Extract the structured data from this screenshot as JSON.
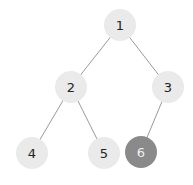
{
  "diagram": {
    "type": "binary-tree",
    "nodes": [
      {
        "id": "1",
        "label": "1",
        "x": 120,
        "y": 25,
        "fill": "#eaeaea",
        "text_color": "#222222",
        "highlighted": false
      },
      {
        "id": "2",
        "label": "2",
        "x": 71,
        "y": 87,
        "fill": "#eaeaea",
        "text_color": "#222222",
        "highlighted": false
      },
      {
        "id": "3",
        "label": "3",
        "x": 168,
        "y": 87,
        "fill": "#eaeaea",
        "text_color": "#222222",
        "highlighted": false
      },
      {
        "id": "4",
        "label": "4",
        "x": 32,
        "y": 153,
        "fill": "#eaeaea",
        "text_color": "#222222",
        "highlighted": false
      },
      {
        "id": "5",
        "label": "5",
        "x": 104,
        "y": 153,
        "fill": "#eaeaea",
        "text_color": "#222222",
        "highlighted": false
      },
      {
        "id": "6",
        "label": "6",
        "x": 141,
        "y": 152,
        "fill": "#8a8a8a",
        "text_color": "#f0f0f0",
        "highlighted": true
      }
    ],
    "edges": [
      {
        "from": "1",
        "to": "2"
      },
      {
        "from": "1",
        "to": "3"
      },
      {
        "from": "2",
        "to": "4"
      },
      {
        "from": "2",
        "to": "5"
      },
      {
        "from": "3",
        "to": "6"
      }
    ],
    "edge_color": "#9a9a9a",
    "node_radius": 16
  }
}
